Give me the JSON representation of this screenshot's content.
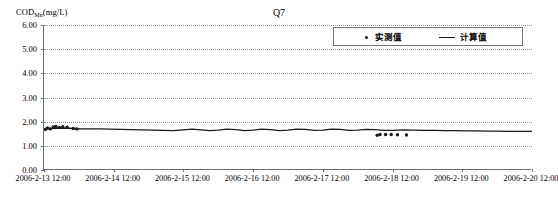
{
  "chart_data": {
    "type": "line",
    "title": "Q7",
    "xlabel": "",
    "ylabel": "CODMn(mg/L)",
    "ylabel_base": "COD",
    "ylabel_sub": "Mn",
    "ylabel_unit": "(mg/L)",
    "ylim": [
      0,
      6
    ],
    "ytick_labels": [
      "6.00",
      "5.00",
      "4.00",
      "3.00",
      "2.00",
      "1.00",
      "0.00"
    ],
    "ytick_values": [
      6,
      5,
      4,
      3,
      2,
      1,
      0
    ],
    "xtick_labels": [
      "2006-2-13 12:00",
      "2006-2-14 12:00",
      "2006-2-15 12:00",
      "2006-2-16 12:00",
      "2006-2-17 12:00",
      "2006-2-18 12:00",
      "2006-2-19 12:00",
      "2006-2-20 12:00"
    ],
    "xlim_days": [
      0,
      7
    ],
    "grid": true,
    "grid_style": "dotted-horizontal",
    "legend_position": "top-right",
    "series": [
      {
        "name": "实测值",
        "type": "scatter",
        "marker": "dot",
        "color": "#1a1a1a",
        "points": [
          {
            "x": 0.02,
            "y": 1.68
          },
          {
            "x": 0.05,
            "y": 1.74
          },
          {
            "x": 0.09,
            "y": 1.7
          },
          {
            "x": 0.13,
            "y": 1.78
          },
          {
            "x": 0.17,
            "y": 1.8
          },
          {
            "x": 0.22,
            "y": 1.76
          },
          {
            "x": 0.27,
            "y": 1.79
          },
          {
            "x": 0.33,
            "y": 1.77
          },
          {
            "x": 0.42,
            "y": 1.72
          },
          {
            "x": 0.47,
            "y": 1.7
          },
          {
            "x": 4.78,
            "y": 1.44
          },
          {
            "x": 4.82,
            "y": 1.47
          },
          {
            "x": 4.9,
            "y": 1.47
          },
          {
            "x": 4.98,
            "y": 1.47
          },
          {
            "x": 5.07,
            "y": 1.46
          },
          {
            "x": 5.2,
            "y": 1.45
          }
        ]
      },
      {
        "name": "计算值",
        "type": "line",
        "color": "#1a1a1a",
        "points": [
          {
            "x": 0.0,
            "y": 1.7
          },
          {
            "x": 0.1,
            "y": 1.72
          },
          {
            "x": 0.22,
            "y": 1.74
          },
          {
            "x": 0.35,
            "y": 1.73
          },
          {
            "x": 0.5,
            "y": 1.71
          },
          {
            "x": 0.65,
            "y": 1.7
          },
          {
            "x": 0.8,
            "y": 1.7
          },
          {
            "x": 0.95,
            "y": 1.69
          },
          {
            "x": 1.1,
            "y": 1.68
          },
          {
            "x": 1.25,
            "y": 1.67
          },
          {
            "x": 1.4,
            "y": 1.66
          },
          {
            "x": 1.55,
            "y": 1.65
          },
          {
            "x": 1.7,
            "y": 1.64
          },
          {
            "x": 1.85,
            "y": 1.63
          },
          {
            "x": 2.0,
            "y": 1.66
          },
          {
            "x": 2.12,
            "y": 1.69
          },
          {
            "x": 2.25,
            "y": 1.66
          },
          {
            "x": 2.38,
            "y": 1.63
          },
          {
            "x": 2.5,
            "y": 1.65
          },
          {
            "x": 2.62,
            "y": 1.69
          },
          {
            "x": 2.75,
            "y": 1.67
          },
          {
            "x": 2.88,
            "y": 1.63
          },
          {
            "x": 3.0,
            "y": 1.65
          },
          {
            "x": 3.12,
            "y": 1.69
          },
          {
            "x": 3.25,
            "y": 1.67
          },
          {
            "x": 3.38,
            "y": 1.63
          },
          {
            "x": 3.5,
            "y": 1.65
          },
          {
            "x": 3.62,
            "y": 1.69
          },
          {
            "x": 3.75,
            "y": 1.68
          },
          {
            "x": 3.88,
            "y": 1.64
          },
          {
            "x": 4.0,
            "y": 1.65
          },
          {
            "x": 4.12,
            "y": 1.69
          },
          {
            "x": 4.25,
            "y": 1.68
          },
          {
            "x": 4.38,
            "y": 1.64
          },
          {
            "x": 4.5,
            "y": 1.65
          },
          {
            "x": 4.62,
            "y": 1.68
          },
          {
            "x": 4.75,
            "y": 1.67
          },
          {
            "x": 4.88,
            "y": 1.64
          },
          {
            "x": 5.0,
            "y": 1.64
          },
          {
            "x": 5.15,
            "y": 1.66
          },
          {
            "x": 5.3,
            "y": 1.65
          },
          {
            "x": 5.45,
            "y": 1.64
          },
          {
            "x": 5.6,
            "y": 1.64
          },
          {
            "x": 5.75,
            "y": 1.63
          },
          {
            "x": 5.9,
            "y": 1.63
          },
          {
            "x": 6.05,
            "y": 1.62
          },
          {
            "x": 6.2,
            "y": 1.62
          },
          {
            "x": 6.35,
            "y": 1.61
          },
          {
            "x": 6.5,
            "y": 1.61
          },
          {
            "x": 6.65,
            "y": 1.6
          },
          {
            "x": 6.8,
            "y": 1.6
          },
          {
            "x": 6.95,
            "y": 1.6
          },
          {
            "x": 7.0,
            "y": 1.6
          }
        ]
      }
    ]
  },
  "legend": {
    "measured_label": "实测值",
    "calculated_label": "计算值"
  }
}
